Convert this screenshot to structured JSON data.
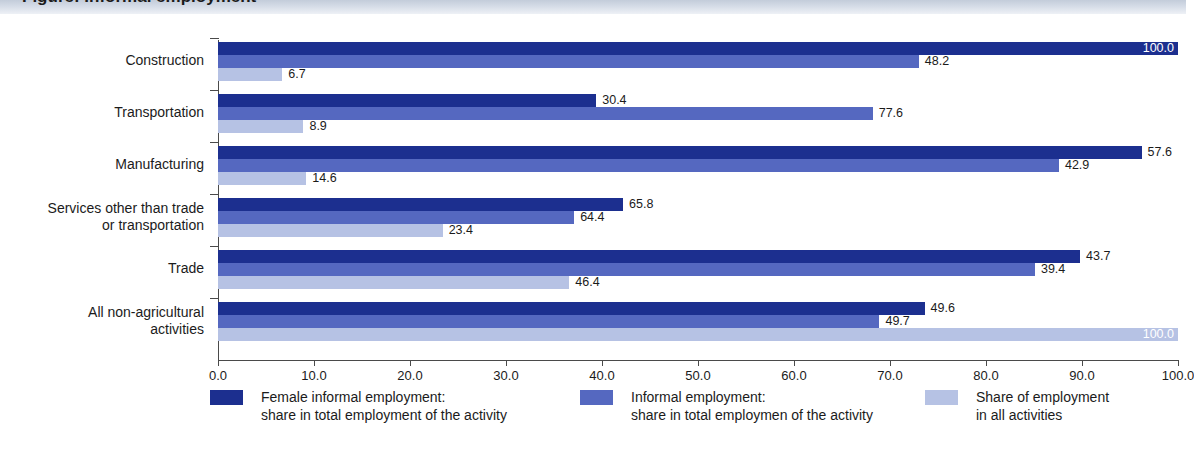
{
  "title": "Figure: Informal employment",
  "chart_data": {
    "type": "bar",
    "orientation": "horizontal",
    "title": "Informal employment",
    "xlabel": "",
    "ylabel": "",
    "xlim": [
      0.0,
      100.0
    ],
    "xticks": [
      "0.0",
      "10.0",
      "20.0",
      "30.0",
      "40.0",
      "50.0",
      "60.0",
      "70.0",
      "80.0",
      "90.0",
      "100.0"
    ],
    "grid": false,
    "legend_position": "bottom",
    "categories": [
      "Construction",
      "Transportation",
      "Manufacturing",
      "Services other than trade\nor transportation",
      "Trade",
      "All non-agricultural\nactivities"
    ],
    "series": [
      {
        "name": "Female informal employment:\nshare in total employment of the activity",
        "color": "#1c2f8f",
        "values": [
          100.0,
          30.4,
          57.6,
          65.8,
          43.7,
          49.6
        ],
        "bar_extents": [
          100.0,
          39.4,
          96.2,
          42.2,
          89.8,
          73.6
        ],
        "labels": [
          "100.0",
          "30.4",
          "57.6",
          "65.8",
          "43.7",
          "49.6"
        ],
        "label_inside": [
          true,
          false,
          false,
          false,
          false,
          false
        ]
      },
      {
        "name": "Informal employment:\nshare in total employmen of the activity",
        "color": "#5568c0",
        "values": [
          48.2,
          77.6,
          42.9,
          64.4,
          39.4,
          49.7
        ],
        "bar_extents": [
          73.0,
          68.2,
          87.6,
          37.1,
          85.1,
          68.9
        ],
        "labels": [
          "48.2",
          "77.6",
          "42.9",
          "64.4",
          "39.4",
          "49.7"
        ],
        "label_inside": [
          false,
          false,
          false,
          false,
          false,
          false
        ]
      },
      {
        "name": "Share of employment\nin all activities",
        "color": "#b6c2e4",
        "values": [
          6.7,
          8.9,
          14.6,
          23.4,
          46.4,
          100.0
        ],
        "bar_extents": [
          6.7,
          8.9,
          9.2,
          23.4,
          36.6,
          100.0
        ],
        "labels": [
          "6.7",
          "8.9",
          "14.6",
          "23.4",
          "46.4",
          "100.0"
        ],
        "label_inside": [
          false,
          false,
          false,
          false,
          false,
          true
        ]
      }
    ]
  },
  "legend": {
    "items": [
      {
        "label": "Female informal employment:\nshare in total employment of the activity",
        "color": "#1c2f8f",
        "swatch": "s0",
        "left": 210
      },
      {
        "label": "Informal employment:\nshare in total employmen of the activity",
        "color": "#5568c0",
        "swatch": "s1",
        "left": 580
      },
      {
        "label": "Share of employment\nin all activities",
        "color": "#b6c2e4",
        "swatch": "s2",
        "left": 925
      }
    ]
  },
  "colors": {
    "series_dark": "#1c2f8f",
    "series_medium": "#5568c0",
    "series_light": "#b6c2e4",
    "axis": "#4a4a4a",
    "text": "#1b1b1b",
    "title_band": "#c3ccda"
  }
}
